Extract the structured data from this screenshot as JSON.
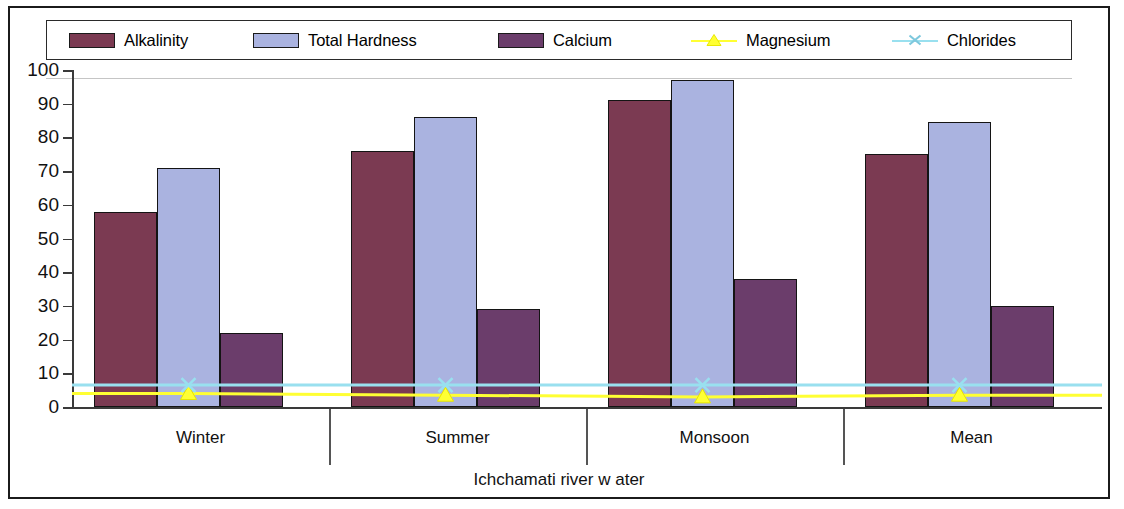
{
  "chart_data": {
    "type": "bar",
    "title": "",
    "xlabel": "Ichchamati river w ater",
    "ylabel": "",
    "categories": [
      "Winter",
      "Summer",
      "Monsoon",
      "Mean"
    ],
    "ylim": [
      0,
      100
    ],
    "yticks": [
      0,
      10,
      20,
      30,
      40,
      50,
      60,
      70,
      80,
      90,
      100
    ],
    "grid": false,
    "legend_position": "top",
    "series": [
      {
        "name": "Alkalinity",
        "kind": "bar",
        "color": "#7b3a52",
        "values": [
          58,
          76,
          91,
          75
        ]
      },
      {
        "name": "Total Hardness",
        "kind": "bar",
        "color": "#aab3e0",
        "values": [
          71,
          86,
          97,
          84.5
        ]
      },
      {
        "name": "Calcium",
        "kind": "bar",
        "color": "#6b3d6b",
        "values": [
          22,
          29,
          38,
          30
        ]
      },
      {
        "name": "Magnesium",
        "kind": "line",
        "color": "#ffff33",
        "marker": "triangle",
        "values": [
          4,
          3.5,
          3,
          3.5
        ]
      },
      {
        "name": "Chlorides",
        "kind": "line",
        "color": "#99e0ef",
        "marker": "x",
        "values": [
          6.5,
          6.5,
          6.5,
          6.5
        ]
      }
    ]
  },
  "legend": {
    "items": [
      {
        "label": "Alkalinity",
        "swatch": "alkalinity-swatch",
        "icon": "bar-swatch-icon"
      },
      {
        "label": "Total Hardness",
        "swatch": "total-hardness-swatch",
        "icon": "bar-swatch-icon"
      },
      {
        "label": "Calcium",
        "swatch": "calcium-swatch",
        "icon": "bar-swatch-icon"
      },
      {
        "label": "Magnesium",
        "swatch": "magnesium-marker",
        "icon": "triangle-marker-icon"
      },
      {
        "label": "Chlorides",
        "swatch": "chlorides-marker",
        "icon": "x-marker-icon"
      }
    ]
  },
  "axis": {
    "y_labels": [
      "100",
      "90",
      "80",
      "70",
      "60",
      "50",
      "40",
      "30",
      "20",
      "10",
      "0"
    ],
    "x_labels": [
      "Winter",
      "Summer",
      "Monsoon",
      "Mean"
    ],
    "x_title": "Ichchamati river w ater"
  },
  "colors": {
    "alkalinity": "#7b3a52",
    "total_hardness": "#aab3e0",
    "calcium": "#6b3d6b",
    "magnesium": "#ffff33",
    "chlorides": "#99e0ef",
    "axis": "#3a3a3a",
    "frame": "#1b1b1b"
  }
}
